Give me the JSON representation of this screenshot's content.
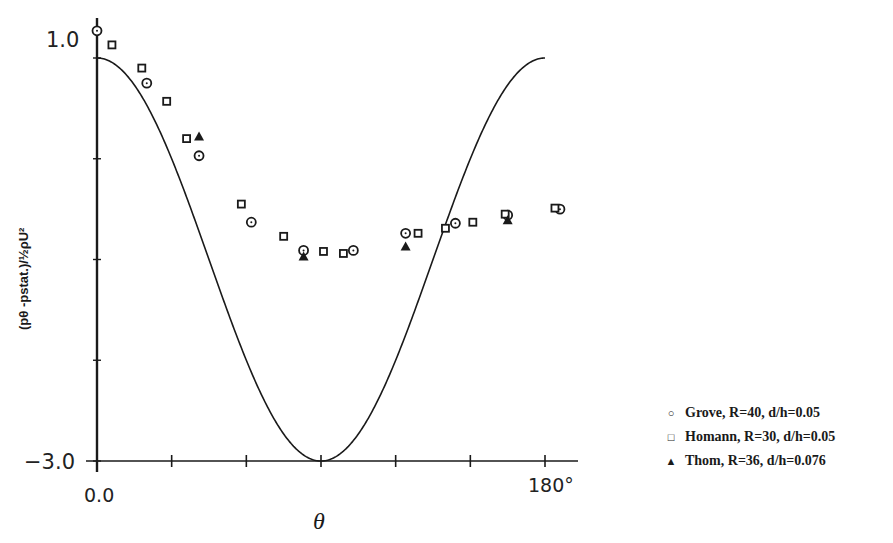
{
  "chart_data": {
    "type": "scatter",
    "title": "",
    "xlabel": "θ",
    "ylabel": "(p_θ - p_stat.)/½ρU²",
    "xlim": [
      0,
      180
    ],
    "ylim": [
      -3.0,
      1.0
    ],
    "x_tick_labels": [
      "0.0",
      "180°"
    ],
    "y_tick_labels": [
      "1.0",
      "-3.0"
    ],
    "x_ticks": [
      0,
      30,
      60,
      90,
      120,
      150,
      180
    ],
    "y_ticks": [
      1.0,
      0.0,
      -1.0,
      -2.0,
      -3.0
    ],
    "grid": false,
    "legend_position": "right-bottom, outside plot",
    "curve": {
      "name": "Potential flow theory 1 - 4sin²θ (solid line)",
      "type": "line",
      "formula": "1 - 4*sin(theta)^2"
    },
    "series": [
      {
        "name": "Grove, R=40, d/h=0.05",
        "marker": "circle",
        "x": [
          0,
          20,
          41,
          62,
          83,
          103,
          124,
          144,
          165,
          186
        ],
        "y": [
          1.27,
          0.75,
          0.03,
          -0.63,
          -0.91,
          -0.91,
          -0.74,
          -0.64,
          -0.56,
          -0.5
        ]
      },
      {
        "name": "Homann, R=30, d/h=0.05",
        "marker": "square",
        "x": [
          6,
          18,
          28,
          36,
          58,
          75,
          91,
          99,
          129,
          140,
          151,
          164,
          184
        ],
        "y": [
          1.13,
          0.9,
          0.57,
          0.2,
          -0.45,
          -0.77,
          -0.92,
          -0.94,
          -0.74,
          -0.69,
          -0.63,
          -0.55,
          -0.49
        ]
      },
      {
        "name": "Thom, R=36, d/h=0.076",
        "marker": "triangle",
        "x": [
          41,
          83,
          124,
          165
        ],
        "y": [
          0.22,
          -0.97,
          -0.87,
          -0.61
        ]
      }
    ]
  },
  "axes": {
    "x_min_label": "0.0",
    "x_max_label": "180°",
    "x_title": "θ",
    "y_max_label": "1.0",
    "y_min_label": "−3.0",
    "y_title": "(pθ -pstat.)/½ρU²"
  },
  "legend": {
    "items": [
      {
        "marker": "○",
        "label": "Grove, R=40, d/h=0.05"
      },
      {
        "marker": "□",
        "label": "Homann, R=30, d/h=0.05"
      },
      {
        "marker": "▲",
        "label": "Thom, R=36, d/h=0.076"
      }
    ]
  }
}
